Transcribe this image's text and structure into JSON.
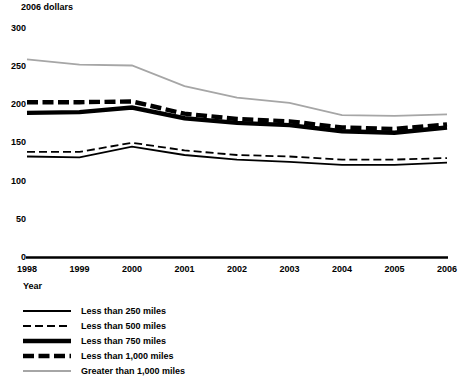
{
  "chart_data": {
    "type": "line",
    "title": "",
    "ylabel": "2006 dollars",
    "xlabel": "Year",
    "categories": [
      1998,
      1999,
      2000,
      2001,
      2002,
      2003,
      2004,
      2005,
      2006
    ],
    "ylim": [
      0,
      300
    ],
    "yticks": [
      0,
      50,
      100,
      150,
      200,
      250,
      300
    ],
    "xlim": [
      1998,
      2006
    ],
    "grid": false,
    "legend_position": "below-axis-left",
    "series": [
      {
        "name": "Less than 250 miles",
        "style": "solid-thin",
        "color": "#000000",
        "values": [
          132,
          131,
          145,
          134,
          128,
          125,
          121,
          121,
          124
        ]
      },
      {
        "name": "Less than 500 miles",
        "style": "dashed-thin",
        "color": "#000000",
        "values": [
          138,
          138,
          150,
          140,
          134,
          132,
          128,
          128,
          130
        ]
      },
      {
        "name": "Less than 750 miles",
        "style": "solid-thick",
        "color": "#000000",
        "values": [
          189,
          190,
          196,
          182,
          176,
          173,
          165,
          163,
          170
        ]
      },
      {
        "name": "Less than 1,000 miles",
        "style": "dashed-thick",
        "color": "#000000",
        "values": [
          203,
          203,
          204,
          188,
          181,
          178,
          170,
          168,
          174
        ]
      },
      {
        "name": "Greater than 1,000 miles",
        "style": "solid-gray",
        "color": "#a6a6a6",
        "values": [
          259,
          252,
          251,
          224,
          209,
          202,
          186,
          185,
          187
        ]
      }
    ]
  },
  "axis": {
    "y_title": "2006 dollars",
    "x_title": "Year",
    "y_ticks": [
      "300",
      "250",
      "200",
      "150",
      "100",
      "50",
      "0"
    ],
    "x_ticks": [
      "1998",
      "1999",
      "2000",
      "2001",
      "2002",
      "2003",
      "2004",
      "2005",
      "2006"
    ]
  },
  "legend": {
    "items": [
      {
        "label": "Less than 250 miles"
      },
      {
        "label": "Less than 500 miles"
      },
      {
        "label": "Less than 750 miles"
      },
      {
        "label": "Less than 1,000 miles"
      },
      {
        "label": "Greater than 1,000 miles"
      }
    ]
  },
  "footnote": {
    "text": ""
  }
}
